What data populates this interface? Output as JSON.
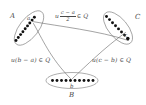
{
  "figure": {
    "type": "set-diagram",
    "background_color": "#ffffff",
    "ink_color": "#3a3a3a",
    "dot_color": "#111111",
    "sets": [
      {
        "id": "A",
        "label": "A",
        "label_position": "left-outside",
        "element_label": "a",
        "dot_count": 9,
        "orientation": "tilted",
        "center": [
          29,
          28
        ],
        "rx": 20,
        "ry": 9,
        "rotation_deg": -52
      },
      {
        "id": "C",
        "label": "C",
        "label_position": "right-outside",
        "element_label": "c",
        "dot_count": 8,
        "orientation": "tilted",
        "center": [
          118,
          28
        ],
        "rx": 19,
        "ry": 9,
        "rotation_deg": 50
      },
      {
        "id": "B",
        "label": "B",
        "label_position": "below-outside",
        "element_label": "b",
        "dot_count": 10,
        "orientation": "horizontal",
        "center": [
          72,
          81
        ],
        "rx": 26,
        "ry": 8,
        "rotation_deg": 0
      }
    ],
    "edges": [
      {
        "id": "edge-a-c",
        "from": "a",
        "to": "c",
        "label_id": "label-ac",
        "label_text_plain": "u (c - a)/2 ∈ Q"
      },
      {
        "id": "edge-a-b",
        "from": "a",
        "to": "b",
        "label_id": "label-ab",
        "label_text_plain": "u(b - a) ∈ Q"
      },
      {
        "id": "edge-b-c",
        "from": "b",
        "to": "c",
        "label_id": "label-bc",
        "label_text_plain": "u(c - b) ∈ Q"
      }
    ],
    "labels": {
      "set_a": "A",
      "set_b": "B",
      "set_c": "C",
      "elem_a": "a",
      "elem_b": "b",
      "elem_c": "c",
      "edge_ac": {
        "prefix": "u",
        "numerator": "c − a",
        "denominator": "2",
        "suffix": "∈ Q"
      },
      "edge_ab": {
        "text": "u(b − a) ∈ Q"
      },
      "edge_bc": {
        "text": "u(c − b) ∈ Q"
      }
    }
  }
}
